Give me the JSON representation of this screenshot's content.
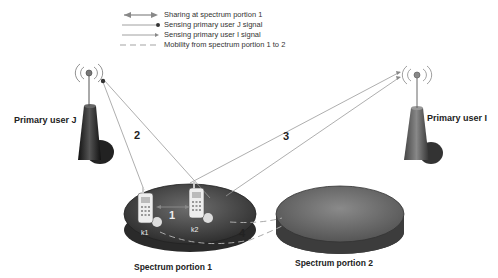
{
  "legend": {
    "items": [
      {
        "label": "Sharing at spectrum portion 1",
        "style": "double-arrow"
      },
      {
        "label": "Sensing primary user J signal",
        "style": "line-dot"
      },
      {
        "label": "Sensing primary user I signal",
        "style": "line-arrow"
      },
      {
        "label": "Mobility from spectrum portion 1 to 2",
        "style": "dashed"
      }
    ]
  },
  "nodes": {
    "primary_user_j": {
      "label": "Primary user J"
    },
    "primary_user_i": {
      "label": "Primary user I"
    },
    "spectrum_portion_1": {
      "label": "Spectrum portion 1"
    },
    "spectrum_portion_2": {
      "label": "Spectrum portion 2"
    },
    "device_k1": {
      "label": "k1"
    },
    "device_k2": {
      "label": "k2"
    }
  },
  "links": {
    "sharing": {
      "number": "1"
    },
    "sensing_j": {
      "number": "2"
    },
    "sensing_i": {
      "number": "3"
    },
    "mobility": {
      "number": "4"
    }
  },
  "colors": {
    "tower": "#2a2a2a",
    "disk_top": "#5a5a5a",
    "disk_side": "#3a3a3a",
    "line": "#888888"
  }
}
